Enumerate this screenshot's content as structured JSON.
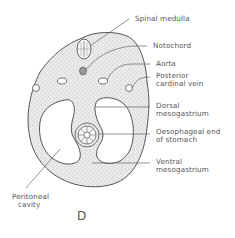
{
  "figure": {
    "caption": "D",
    "labels": {
      "spinal_medulla": "Spinal medulla",
      "notochord": "Notochord",
      "aorta": "Aorta",
      "posterior_cardinal_vein_1": "Posterior",
      "posterior_cardinal_vein_2": "cardinal vein",
      "dorsal_mesogastrium_1": "Dorsal",
      "dorsal_mesogastrium_2": "mesogastrium",
      "oesophageal_end_1": "Oesophageal end",
      "oesophageal_end_2": "of stomach",
      "ventral_mesogastrium_1": "Ventral",
      "ventral_mesogastrium_2": "mesogastrium",
      "peritoneal_cavity_1": "Peritoneal",
      "peritoneal_cavity_2": "cavity"
    },
    "colors": {
      "line": "#555555",
      "stipple": "#9a9a9a",
      "background": "#ffffff"
    }
  }
}
